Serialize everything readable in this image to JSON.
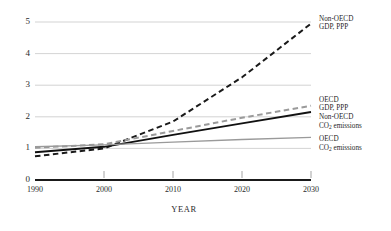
{
  "chart_data": {
    "type": "line",
    "title": "",
    "xlabel": "YEAR",
    "ylabel": "",
    "x": [
      1990,
      2000,
      2010,
      2020,
      2030
    ],
    "xlim": [
      1990,
      2030
    ],
    "ylim": [
      0,
      5
    ],
    "yticks": [
      "0",
      "1",
      "2",
      "3",
      "4",
      "5"
    ],
    "xticks": [
      "1990",
      "2000",
      "2010",
      "2020",
      "2030"
    ],
    "grid": "horizontal",
    "legend_position": "right-inline-labels",
    "series": [
      {
        "name": "Non-OECD GDP, PPP",
        "label_line1": "Non-OECD",
        "label_line2": "GDP, PPP",
        "style": "dashed",
        "color": "#1a1a1a",
        "width": 2.0,
        "values": [
          0.75,
          1.0,
          1.85,
          3.25,
          4.95
        ]
      },
      {
        "name": "OECD GDP, PPP",
        "label_line1": "OECD",
        "label_line2": "GDP, PPP",
        "style": "dashed",
        "color": "#9a9a9a",
        "width": 2.0,
        "values": [
          1.02,
          1.13,
          1.55,
          1.97,
          2.35
        ]
      },
      {
        "name": "Non-OECD CO2 emissions",
        "label_line1": "Non-OECD",
        "label_line2": "CO₂ emissions",
        "style": "solid",
        "color": "#111111",
        "width": 1.9,
        "values": [
          0.88,
          1.05,
          1.43,
          1.79,
          2.15
        ]
      },
      {
        "name": "OECD CO2 emissions",
        "label_line1": "OECD",
        "label_line2": "CO₂ emissions",
        "style": "solid",
        "color": "#9a9a9a",
        "width": 1.4,
        "values": [
          1.05,
          1.11,
          1.2,
          1.28,
          1.35
        ]
      }
    ],
    "colors": {
      "gridline": "#c8c8c8",
      "axis": "#1a1a1a",
      "dark_series": "#1a1a1a",
      "light_series": "#9a9a9a",
      "background": "#ffffff"
    }
  }
}
